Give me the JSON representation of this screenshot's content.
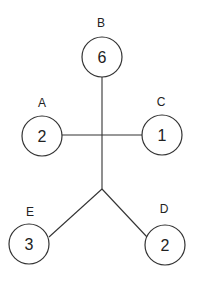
{
  "diagram": {
    "type": "tree",
    "nodes": [
      {
        "id": "B",
        "label": "B",
        "value": "6"
      },
      {
        "id": "A",
        "label": "A",
        "value": "2"
      },
      {
        "id": "C",
        "label": "C",
        "value": "1"
      },
      {
        "id": "E",
        "label": "E",
        "value": "3"
      },
      {
        "id": "D",
        "label": "D",
        "value": "2"
      }
    ],
    "edges": [
      [
        "B",
        "junction-1"
      ],
      [
        "A",
        "junction-1"
      ],
      [
        "C",
        "junction-1"
      ],
      [
        "junction-1",
        "junction-2"
      ],
      [
        "junction-2",
        "E"
      ],
      [
        "junction-2",
        "D"
      ]
    ]
  }
}
